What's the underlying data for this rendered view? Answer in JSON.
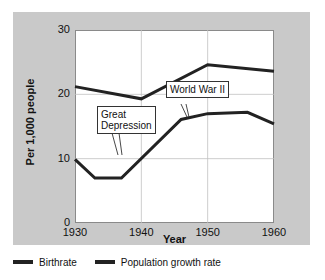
{
  "chart_data": {
    "type": "line",
    "title": "",
    "xlabel": "Year",
    "ylabel": "Per 1,000 people",
    "xlim": [
      1930,
      1960
    ],
    "ylim": [
      0,
      30
    ],
    "xticks": [
      "1930",
      "1940",
      "1950",
      "1960"
    ],
    "yticks": [
      "0",
      "10",
      "20",
      "30"
    ],
    "grid": true,
    "legend_position": "bottom-left",
    "series": [
      {
        "name": "Birthrate",
        "color": "#222222",
        "x": [
          1930,
          1940,
          1950,
          1960
        ],
        "values": [
          21.2,
          19.3,
          24.6,
          23.6
        ]
      },
      {
        "name": "Population growth rate",
        "color": "#222222",
        "x": [
          1930,
          1933,
          1937,
          1946,
          1950,
          1956,
          1960
        ],
        "values": [
          9.9,
          7.0,
          7.0,
          16.1,
          17.0,
          17.2,
          15.4
        ]
      }
    ],
    "annotations": [
      {
        "text": "Great\nDepression",
        "points_to_year": 1933,
        "points_to_value": 7.0
      },
      {
        "text": "World War II",
        "points_to_year": 1945,
        "points_to_value": 15.6
      }
    ]
  },
  "legend": {
    "items": [
      {
        "label": "Birthrate"
      },
      {
        "label": "Population growth rate"
      }
    ]
  }
}
